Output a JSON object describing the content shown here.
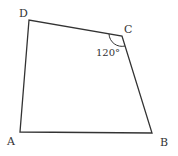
{
  "diagram": {
    "type": "quadrilateral",
    "stroke_color": "#333333",
    "vertices": [
      {
        "name": "A",
        "label": "A",
        "x": 20,
        "y": 132,
        "label_x": 7,
        "label_y": 145
      },
      {
        "name": "B",
        "label": "B",
        "x": 152,
        "y": 133,
        "label_x": 160,
        "label_y": 146
      },
      {
        "name": "C",
        "label": "C",
        "x": 122,
        "y": 36,
        "label_x": 124,
        "label_y": 33
      },
      {
        "name": "D",
        "label": "D",
        "x": 29,
        "y": 20,
        "label_x": 19,
        "label_y": 17
      }
    ],
    "angle": {
      "vertex": "C",
      "label": "120°",
      "label_x": 96,
      "label_y": 56
    }
  }
}
